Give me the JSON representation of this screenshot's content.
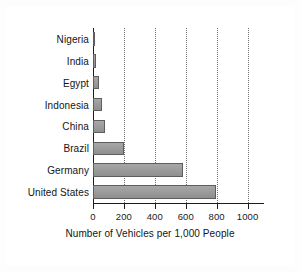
{
  "chart_data": {
    "type": "bar",
    "orientation": "horizontal",
    "title": "",
    "xlabel": "Number of Vehicles per 1,000 People",
    "ylabel": "",
    "categories": [
      "Nigeria",
      "India",
      "Egypt",
      "Indonesia",
      "China",
      "Brazil",
      "Germany",
      "United States"
    ],
    "values": [
      15,
      18,
      37,
      57,
      76,
      202,
      582,
      797
    ],
    "xticks": [
      0,
      200,
      400,
      600,
      800,
      1000
    ],
    "xtick_labels": [
      "0",
      "200",
      "400",
      "600",
      "800",
      "1000"
    ],
    "xlim": [
      0,
      1100
    ],
    "grid": "vertical-dotted",
    "legend": null,
    "series": [
      {
        "name": "Vehicles per 1,000 People",
        "values": [
          15,
          18,
          37,
          57,
          76,
          202,
          582,
          797
        ]
      }
    ],
    "colors": {
      "bar_fill": "#9a9a9a",
      "bar_stroke": "#5e5e5e",
      "axis": "#1c1c1c",
      "gridline": "#6f6f6f",
      "text": "#141414",
      "background": "#ffffff",
      "page_background": "#f2f2f2"
    }
  }
}
